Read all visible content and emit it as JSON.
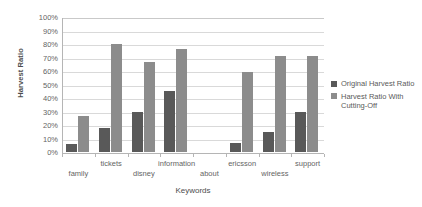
{
  "chart_data": {
    "type": "bar",
    "title": "",
    "xlabel": "Keywords",
    "ylabel": "Harvest Ratio",
    "ylim": [
      0,
      100
    ],
    "grid": true,
    "legend_position": "right",
    "categories": [
      "family",
      "tickets",
      "disney",
      "information",
      "about",
      "ericsson",
      "wireless",
      "support"
    ],
    "ytick_labels": [
      "100%",
      "90%",
      "80%",
      "70%",
      "60%",
      "50%",
      "40%",
      "30%",
      "20%",
      "10%",
      "0%"
    ],
    "ytick_values": [
      100,
      90,
      80,
      70,
      60,
      50,
      40,
      30,
      20,
      10,
      0
    ],
    "series": [
      {
        "name": "Original Harvest Ratio",
        "color": "#595959",
        "values": [
          6,
          18,
          30,
          45,
          0,
          7,
          15,
          30
        ]
      },
      {
        "name": "Harvest Ratio With Cutting-Off",
        "color": "#8c8c8c",
        "values": [
          27,
          80,
          67,
          76,
          0,
          59,
          71,
          71
        ]
      }
    ]
  },
  "legend": {
    "entries": [
      {
        "label": "Original Harvest Ratio"
      },
      {
        "label": "Harvest Ratio With Cutting-Off"
      }
    ]
  }
}
